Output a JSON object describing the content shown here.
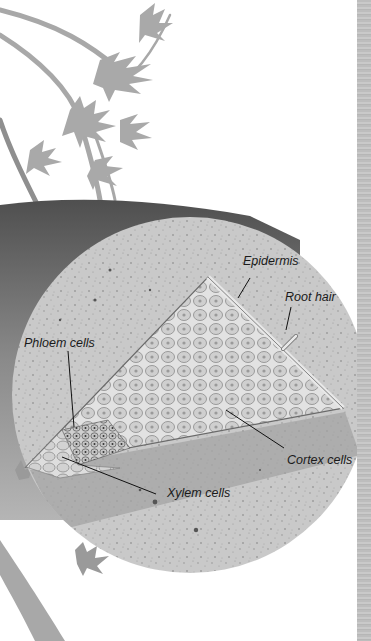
{
  "diagram": {
    "labels": {
      "epidermis": "Epidermis",
      "root_hair": "Root hair",
      "phloem": "Phloem cells",
      "cortex": "Cortex cells",
      "xylem": "Xylem cells"
    },
    "colors": {
      "background": "#ffffff",
      "cross_section": "#c6c6c6",
      "root_outer": "#6e6e6e",
      "cells_fill": "#d8d8d8",
      "cell_outline": "#7a7a7a",
      "leader_line": "#111111",
      "foliage": "#a6a6a6",
      "page_edge": "#c0c0c0"
    }
  }
}
